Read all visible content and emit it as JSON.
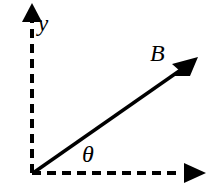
{
  "figure": {
    "background_color": "#ffffff",
    "stroke_color": "#000000",
    "width": 214,
    "height": 193
  },
  "labels": {
    "y_axis": "y",
    "vector": "B",
    "angle": "θ"
  },
  "axes": {
    "origin": {
      "x": 32,
      "y": 173
    },
    "x_axis": {
      "name": "x-axis",
      "style": "dashed",
      "end": {
        "x": 205,
        "y": 173
      },
      "arrowhead": "solid-triangle-right"
    },
    "y_axis": {
      "name": "y-axis",
      "style": "dashed",
      "end": {
        "x": 32,
        "y": 5
      },
      "arrowhead": "solid-triangle-up"
    }
  },
  "vector": {
    "name": "B",
    "style": "solid",
    "start": {
      "x": 32,
      "y": 173
    },
    "tip": {
      "x": 197,
      "y": 58
    },
    "angle_degrees": 34,
    "arrowhead": "barbed-arrow"
  }
}
